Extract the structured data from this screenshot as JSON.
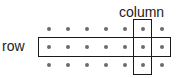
{
  "diagram": {
    "row_label": "row",
    "column_label": "column",
    "grid": {
      "rows": 3,
      "columns": 7
    },
    "highlighted_row_index": 1,
    "highlighted_column_index": 5,
    "colors": {
      "dot": "#6b6b6b",
      "outline": "#1a1a1a",
      "text": "#222222",
      "background": "#ffffff"
    }
  }
}
